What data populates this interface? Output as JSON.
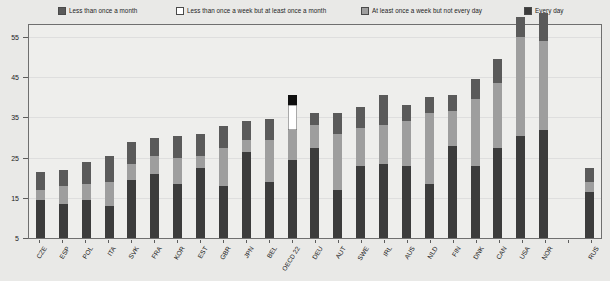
{
  "legend": {
    "entries": [
      {
        "label": "Less than once a month",
        "color": "#5a5a5a",
        "x": 58
      },
      {
        "label": "Less than once a week but at least once a month",
        "color": "#ffffff",
        "x": 176
      },
      {
        "label": "At least once a week but not every day",
        "color": "#9e9e9e",
        "x": 361
      },
      {
        "label": "Every day",
        "color": "#3c3c3c",
        "x": 524
      }
    ]
  },
  "yaxis": {
    "ticks": [
      5,
      15,
      25,
      35,
      45,
      55
    ],
    "min": 5,
    "max": 58
  },
  "chart_data": {
    "type": "bar",
    "subtype": "stacked-vertical",
    "title": "",
    "subtitle": "",
    "xlabel": "",
    "ylabel": "",
    "ylim": [
      5,
      58
    ],
    "grid": true,
    "legend_position": "top",
    "categories": [
      "CZE",
      "ESP",
      "POL",
      "ITA",
      "SVK",
      "FRA",
      "KOR",
      "EST",
      "GBR",
      "JPN",
      "BEL",
      "OECD 22",
      "DEU",
      "AUT",
      "SWE",
      "IRL",
      "AUS",
      "NLD",
      "FIN",
      "DNK",
      "CAN",
      "USA",
      "NOR",
      "",
      "RUS"
    ],
    "series": [
      {
        "name": "Every day",
        "color": "#3c3c3c",
        "values": [
          9.5,
          8.5,
          9.5,
          8.0,
          14.5,
          16.0,
          13.5,
          17.5,
          13.0,
          21.5,
          14.0,
          19.5,
          22.5,
          12.0,
          18.0,
          18.5,
          18.0,
          13.5,
          23.0,
          18.0,
          22.5,
          25.5,
          27.0,
          null,
          11.5
        ]
      },
      {
        "name": "At least once a week but not every day",
        "color": "#9e9e9e",
        "values": [
          2.5,
          4.5,
          4.0,
          6.0,
          4.0,
          4.5,
          6.5,
          3.0,
          9.5,
          3.0,
          10.5,
          7.5,
          5.5,
          14.0,
          9.5,
          9.5,
          11.0,
          17.5,
          8.5,
          16.5,
          16.0,
          24.5,
          22.0,
          null,
          2.5
        ]
      },
      {
        "name": "Less than once a week but at least once a month",
        "color": "#ffffff",
        "values": [
          0,
          0,
          0,
          0,
          0,
          0,
          0,
          0,
          0,
          0,
          0,
          6.0,
          0,
          0,
          0,
          0,
          0,
          0,
          0,
          0,
          0,
          0,
          0,
          null,
          0
        ]
      },
      {
        "name": "Less than once a month",
        "color": "#5a5a5a",
        "values": [
          4.5,
          4.0,
          5.5,
          6.5,
          5.5,
          4.5,
          5.5,
          5.5,
          5.5,
          4.5,
          5.0,
          2.5,
          3.0,
          5.0,
          5.0,
          7.5,
          4.0,
          4.0,
          4.0,
          5.0,
          6.0,
          5.0,
          7.0,
          null,
          3.5
        ]
      }
    ],
    "totals": [
      16.5,
      17.0,
      19.0,
      20.5,
      24.0,
      25.0,
      25.5,
      26.0,
      28.0,
      29.0,
      29.5,
      35.5,
      31.0,
      31.0,
      32.5,
      35.5,
      33.0,
      35.0,
      35.5,
      39.5,
      44.5,
      55.0,
      56.0,
      null,
      17.5
    ],
    "highlighted_category": "OECD 22"
  }
}
